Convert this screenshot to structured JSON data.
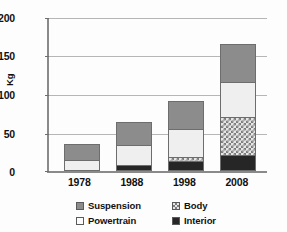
{
  "chart_data": {
    "type": "bar",
    "stacked": true,
    "title": "",
    "subtitle": "",
    "xlabel": "",
    "ylabel": "Kg",
    "categories": [
      "1978",
      "1988",
      "1998",
      "2008"
    ],
    "ylim": [
      0,
      200
    ],
    "yticks": [
      0,
      50,
      100,
      150,
      200
    ],
    "ytick_labels": [
      "0",
      "50",
      "100",
      "150",
      "200"
    ],
    "grid": true,
    "legend_position": "bottom",
    "series": [
      {
        "name": "Interior",
        "values": [
          0,
          5,
          11,
          18
        ],
        "color": "#262626",
        "pattern": "solid"
      },
      {
        "name": "Body",
        "values": [
          0,
          0,
          4,
          49
        ],
        "color": "#e6e6e6",
        "pattern": "checkered"
      },
      {
        "name": "Powertrain",
        "values": [
          12,
          25,
          35,
          44
        ],
        "color": "#efefef",
        "pattern": "solid"
      },
      {
        "name": "Suspension",
        "values": [
          19,
          29,
          35,
          49
        ],
        "color": "#8c8c8c",
        "pattern": "solid"
      }
    ],
    "totals": [
      31,
      59,
      85,
      160
    ],
    "stack_order_bottom_to_top": [
      "Interior",
      "Body",
      "Powertrain",
      "Suspension"
    ]
  },
  "legend": {
    "items": [
      {
        "label": "Suspension",
        "swatch": "swatch-suspension"
      },
      {
        "label": "Body",
        "swatch": "swatch-body"
      },
      {
        "label": "Powertrain",
        "swatch": "swatch-powertrain"
      },
      {
        "label": "Interior",
        "swatch": "swatch-interior"
      }
    ]
  },
  "axes": {
    "y_title": "Kg"
  },
  "colors": {
    "suspension": "#8c8c8c",
    "powertrain": "#efefef",
    "body": "#e6e6e6",
    "interior": "#262626",
    "axis": "#8a8a8a",
    "grid": "#b6b6b6",
    "text": "#111111",
    "background": "#ffffff"
  }
}
